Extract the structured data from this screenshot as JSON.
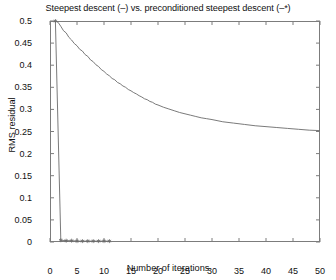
{
  "chart_data": {
    "type": "line",
    "title": "Steepest descent (–) vs. preconditioned steepest descent (–*)",
    "xlabel": "Number of iterations",
    "ylabel": "RMS residual",
    "xlim": [
      0,
      50
    ],
    "ylim": [
      0,
      0.5
    ],
    "grid": false,
    "legend": "none",
    "xticks": [
      0,
      5,
      10,
      15,
      20,
      25,
      30,
      35,
      40,
      45,
      50
    ],
    "xtick_labels": [
      "0",
      "5",
      "10",
      "15",
      "20",
      "25",
      "30",
      "35",
      "40",
      "45",
      "50"
    ],
    "yticks": [
      0,
      0.05,
      0.1,
      0.15,
      0.2,
      0.25,
      0.3,
      0.35,
      0.4,
      0.45,
      0.5
    ],
    "ytick_labels": [
      "0",
      "0.05",
      "0.1",
      "0.15",
      "0.2",
      "0.25",
      "0.3",
      "0.35",
      "0.4",
      "0.45",
      "0.5"
    ],
    "series": [
      {
        "name": "Steepest descent (–)",
        "style": "line",
        "marker": "none",
        "color": "#6b6b6b",
        "x": [
          1,
          1.5,
          2,
          2.5,
          3,
          3.5,
          4,
          4.5,
          5,
          5.5,
          6,
          6.5,
          7,
          7.5,
          8,
          8.5,
          9,
          9.5,
          10,
          10.5,
          11,
          11.5,
          12,
          12.5,
          13,
          13.5,
          14,
          14.5,
          15,
          15.5,
          16,
          16.5,
          17,
          17.5,
          18,
          18.5,
          19,
          19.5,
          20,
          21,
          22,
          23,
          24,
          25,
          26,
          27,
          28,
          29,
          30,
          32,
          34,
          36,
          38,
          40,
          42,
          44,
          46,
          48,
          50
        ],
        "y": [
          0.5,
          0.497,
          0.488,
          0.478,
          0.473,
          0.463,
          0.457,
          0.449,
          0.444,
          0.436,
          0.432,
          0.424,
          0.42,
          0.412,
          0.408,
          0.401,
          0.397,
          0.39,
          0.386,
          0.38,
          0.376,
          0.37,
          0.367,
          0.361,
          0.358,
          0.353,
          0.35,
          0.345,
          0.342,
          0.338,
          0.335,
          0.331,
          0.328,
          0.324,
          0.322,
          0.318,
          0.316,
          0.312,
          0.31,
          0.305,
          0.301,
          0.297,
          0.293,
          0.29,
          0.287,
          0.284,
          0.281,
          0.279,
          0.277,
          0.272,
          0.269,
          0.266,
          0.263,
          0.261,
          0.259,
          0.257,
          0.255,
          0.253,
          0.252
        ]
      },
      {
        "name": "Preconditioned steepest descent (–*)",
        "style": "line-with-markers",
        "marker": "asterisk",
        "color": "#6b6b6b",
        "x": [
          1,
          2,
          3,
          4,
          5,
          6,
          7,
          8,
          9,
          10,
          11
        ],
        "y": [
          0.5,
          0.004,
          0.003,
          0.003,
          0.002,
          0.002,
          0.002,
          0.002,
          0.002,
          0.002,
          0.002
        ]
      }
    ]
  }
}
